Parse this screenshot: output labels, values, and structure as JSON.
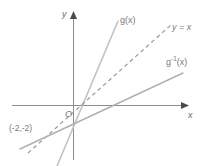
{
  "figure": {
    "type": "coordinate-plane-graph",
    "background_color": "#ffffff",
    "axis_color": "#8d8d8d",
    "line_color": "#b9b9b9",
    "dashed_color": "#9a9a9a",
    "text_color": "#7a7a7a"
  },
  "axes": {
    "x_label": "x",
    "y_label": "y",
    "origin_label": "O",
    "x_axis": {
      "y_px": 105,
      "x_start_px": 12,
      "x_end_px": 186
    },
    "y_axis": {
      "x_px": 73,
      "y_start_px": 14,
      "y_end_px": 160
    }
  },
  "curves": [
    {
      "name": "g",
      "label": "g(x)",
      "style": "solid",
      "color": "#c2c2c2",
      "description": "steep increasing line through (-2,-2)",
      "points_px": [
        [
          58,
          166
        ],
        [
          118,
          22
        ]
      ]
    },
    {
      "name": "y-equals-x",
      "label": "y = x",
      "label_plain": "y = x",
      "style": "dashed",
      "color": "#9a9a9a",
      "description": "identity line of reflection through origin and (-2,-2)",
      "points_px": [
        [
          30,
          152
        ],
        [
          170,
          26
        ]
      ]
    },
    {
      "name": "g-inverse",
      "label_base": "g",
      "label_sup": "-1",
      "label_arg": "(x)",
      "label_plain": "g⁻¹(x)",
      "style": "solid",
      "color": "#b0b0b0",
      "description": "shallow increasing line, reflection of g across y = x",
      "points_px": [
        [
          22,
          148
        ],
        [
          182,
          74
        ]
      ]
    }
  ],
  "annotations": [
    {
      "name": "intersection-point",
      "text": "(-2,-2)",
      "description": "common point of g, g inverse and y = x",
      "x_px": 10,
      "y_px": 124
    }
  ]
}
